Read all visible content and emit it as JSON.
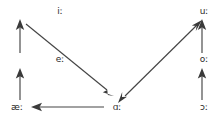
{
  "diagram": {
    "type": "vowel-shift-chain-diagram",
    "width": 221,
    "height": 118,
    "background_color": "#ffffff",
    "stroke_color": "#444444",
    "arrowhead_color": "#3a3a3a",
    "text_color": "#2b2b2b",
    "nodes": [
      {
        "id": "i",
        "label": "iː",
        "x": 60,
        "y": 14,
        "position": "top-left"
      },
      {
        "id": "u",
        "label": "uː",
        "x": 204,
        "y": 14,
        "position": "top-right"
      },
      {
        "id": "e",
        "label": "eː",
        "x": 60,
        "y": 62,
        "position": "middle-left"
      },
      {
        "id": "o",
        "label": "oː",
        "x": 204,
        "y": 62,
        "position": "middle-right"
      },
      {
        "id": "ae",
        "label": "æː",
        "x": 17,
        "y": 110,
        "position": "bottom-left"
      },
      {
        "id": "a",
        "label": "ɑː",
        "x": 117,
        "y": 110,
        "position": "bottom-center"
      },
      {
        "id": "open_o",
        "label": "ɔː",
        "x": 204,
        "y": 110,
        "position": "bottom-right"
      }
    ],
    "edges": [
      {
        "from": "ae",
        "to": "e",
        "direction": "up",
        "arrowheads": "end"
      },
      {
        "from": "e",
        "to": "i",
        "direction": "up",
        "arrowheads": "end"
      },
      {
        "from": "open_o",
        "to": "o",
        "direction": "up",
        "arrowheads": "end"
      },
      {
        "from": "o",
        "to": "u",
        "direction": "up",
        "arrowheads": "end"
      },
      {
        "from": "a",
        "to": "ae",
        "direction": "left",
        "arrowheads": "end"
      },
      {
        "from": "i",
        "to": "a",
        "direction": "diagonal-down-right",
        "arrowheads": "end"
      },
      {
        "from": "a",
        "to": "u",
        "direction": "diagonal-up-right",
        "arrowheads": "both"
      }
    ]
  }
}
